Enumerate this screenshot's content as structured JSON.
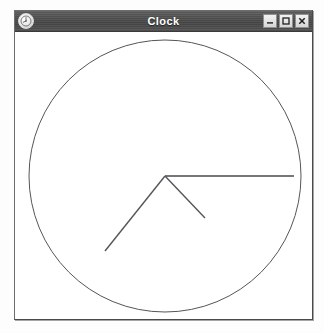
{
  "window": {
    "title": "Clock",
    "menu_icon": "clock-app-icon",
    "buttons": [
      {
        "name": "minimize",
        "label": "–",
        "icon": "minimize-icon"
      },
      {
        "name": "maximize",
        "label": "□",
        "icon": "maximize-icon"
      },
      {
        "name": "close",
        "label": "✕",
        "icon": "close-icon"
      }
    ]
  },
  "clock": {
    "face": {
      "center_x": 150,
      "center_y": 143,
      "radius": 136,
      "outline_color": "#55555a",
      "outline_width": 1,
      "background_color": "#ffffff",
      "has_tick_marks": false,
      "has_numerals": false
    },
    "hands": [
      {
        "name": "second-hand",
        "angle_degrees": 90,
        "length": 129,
        "width": 1.6,
        "color": "#4a4a4f",
        "end_x": 279,
        "end_y": 143
      },
      {
        "name": "hour-hand",
        "angle_degrees": 136,
        "length": 58,
        "width": 1.4,
        "color": "#55555a",
        "end_x": 190,
        "end_y": 185
      },
      {
        "name": "minute-hand",
        "angle_degrees": 216,
        "length": 103,
        "width": 1.4,
        "color": "#55555a",
        "end_x": 90,
        "end_y": 218
      }
    ],
    "displayed_time": "7:38:15"
  }
}
